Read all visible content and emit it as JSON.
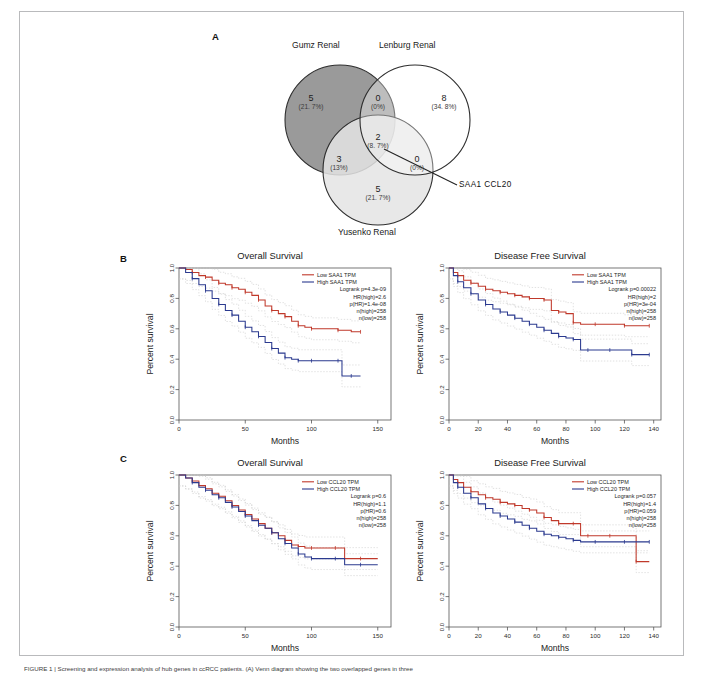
{
  "figure": {
    "panels": [
      {
        "letter": "A"
      },
      {
        "letter": "B"
      },
      {
        "letter": "C"
      }
    ],
    "caption": "FIGURE 1 | Screening and expression analysis of hub genes in ccRCC patients. (A) Venn diagram showing the two overlapped genes in three"
  },
  "venn": {
    "sets": [
      {
        "name": "Gumz Renal",
        "fill": "#9a9a9a"
      },
      {
        "name": "Lenburg Renal",
        "fill": "#ffffff"
      },
      {
        "name": "Yusenko Renal",
        "fill": "#e8e8e8"
      }
    ],
    "regions": [
      {
        "id": "gumz-only",
        "count": "5",
        "percent": "(21. 7%)"
      },
      {
        "id": "gumz-lenburg",
        "count": "0",
        "percent": "(0%)"
      },
      {
        "id": "lenburg-only",
        "count": "8",
        "percent": "(34. 8%)"
      },
      {
        "id": "gumz-yusenko",
        "count": "3",
        "percent": "(13%)"
      },
      {
        "id": "all-three",
        "count": "2",
        "percent": "(8. 7%)"
      },
      {
        "id": "lenburg-yusenko",
        "count": "0",
        "percent": "(0%)"
      },
      {
        "id": "yusenko-only",
        "count": "5",
        "percent": "(21. 7%)"
      }
    ],
    "annotation": "SAA1  CCL20"
  },
  "charts": [
    {
      "id": "panel-b-os",
      "panel": "B",
      "chart_data": {
        "type": "line",
        "title": "Overall Survival",
        "xlabel": "Months",
        "ylabel": "Percent survival",
        "xlim": [
          0,
          160
        ],
        "ylim": [
          0,
          1.0
        ],
        "xticks": [
          0,
          50,
          100,
          150
        ],
        "yticks": [
          "0.0",
          "0.2",
          "0.4",
          "0.6",
          "0.8",
          "1.0"
        ],
        "grid": false,
        "legend_position": "top-right",
        "legend": [
          "Low SAA1 TPM",
          "High SAA1 TPM"
        ],
        "stats": [
          "Logrank p=4.3e-09",
          "HR(high)=2.6",
          "p(HR)=1.4e-08",
          "n(high)=258",
          "n(low)=258"
        ],
        "series": [
          {
            "name": "Low SAA1 TPM",
            "color": "#c0392b",
            "x": [
              0,
              5,
              10,
              15,
              20,
              25,
              30,
              35,
              40,
              45,
              50,
              55,
              60,
              65,
              70,
              75,
              80,
              85,
              90,
              95,
              100,
              110,
              120,
              130,
              137
            ],
            "y": [
              1.0,
              0.99,
              0.97,
              0.95,
              0.94,
              0.92,
              0.9,
              0.89,
              0.87,
              0.86,
              0.84,
              0.82,
              0.79,
              0.75,
              0.72,
              0.7,
              0.68,
              0.65,
              0.62,
              0.61,
              0.6,
              0.6,
              0.59,
              0.58,
              0.58
            ]
          },
          {
            "name": "High SAA1 TPM",
            "color": "#2b3a8f",
            "x": [
              0,
              5,
              10,
              15,
              20,
              25,
              30,
              35,
              40,
              45,
              50,
              55,
              60,
              65,
              70,
              75,
              80,
              85,
              90,
              95,
              100,
              110,
              120,
              123,
              130,
              137
            ],
            "y": [
              1.0,
              0.97,
              0.93,
              0.89,
              0.85,
              0.8,
              0.76,
              0.72,
              0.69,
              0.65,
              0.61,
              0.58,
              0.55,
              0.51,
              0.47,
              0.44,
              0.41,
              0.4,
              0.39,
              0.39,
              0.39,
              0.39,
              0.39,
              0.29,
              0.29,
              0.29
            ]
          }
        ]
      }
    },
    {
      "id": "panel-b-dfs",
      "panel": "B",
      "chart_data": {
        "type": "line",
        "title": "Disease Free Survival",
        "xlabel": "Months",
        "ylabel": "Percent survival",
        "xlim": [
          0,
          145
        ],
        "ylim": [
          0,
          1.0
        ],
        "xticks": [
          0,
          20,
          40,
          60,
          80,
          100,
          120,
          140
        ],
        "yticks": [
          "0.0",
          "0.2",
          "0.4",
          "0.6",
          "0.8",
          "1.0"
        ],
        "grid": false,
        "legend_position": "top-right",
        "legend": [
          "Low SAA1 TPM",
          "High SAA1 TPM"
        ],
        "stats": [
          "Logrank p=0.00022",
          "HR(high)=2",
          "p(HR)=3e-04",
          "n(high)=258",
          "n(low)=258"
        ],
        "series": [
          {
            "name": "Low SAA1 TPM",
            "color": "#c0392b",
            "x": [
              0,
              3,
              6,
              10,
              15,
              20,
              25,
              30,
              35,
              40,
              45,
              50,
              55,
              60,
              65,
              70,
              75,
              80,
              85,
              90,
              100,
              110,
              120,
              130,
              137
            ],
            "y": [
              1.0,
              0.97,
              0.95,
              0.92,
              0.9,
              0.88,
              0.86,
              0.85,
              0.84,
              0.83,
              0.82,
              0.81,
              0.8,
              0.8,
              0.79,
              0.72,
              0.71,
              0.7,
              0.64,
              0.63,
              0.63,
              0.63,
              0.62,
              0.62,
              0.62
            ]
          },
          {
            "name": "High SAA1 TPM",
            "color": "#2b3a8f",
            "x": [
              0,
              3,
              6,
              10,
              15,
              20,
              25,
              30,
              35,
              40,
              45,
              50,
              55,
              60,
              65,
              70,
              75,
              80,
              85,
              90,
              95,
              100,
              110,
              120,
              125,
              130,
              137
            ],
            "y": [
              1.0,
              0.95,
              0.91,
              0.87,
              0.83,
              0.79,
              0.76,
              0.73,
              0.71,
              0.69,
              0.67,
              0.65,
              0.63,
              0.61,
              0.59,
              0.57,
              0.55,
              0.54,
              0.53,
              0.46,
              0.46,
              0.46,
              0.46,
              0.46,
              0.43,
              0.43,
              0.43
            ]
          }
        ]
      }
    },
    {
      "id": "panel-c-os",
      "panel": "C",
      "chart_data": {
        "type": "line",
        "title": "Overall Survival",
        "xlabel": "Months",
        "ylabel": "Percent survival",
        "xlim": [
          0,
          160
        ],
        "ylim": [
          0,
          1.0
        ],
        "xticks": [
          0,
          50,
          100,
          150
        ],
        "yticks": [
          "0.0",
          "0.2",
          "0.4",
          "0.6",
          "0.8",
          "1.0"
        ],
        "grid": false,
        "legend_position": "top-right",
        "legend": [
          "Low CCL20 TPM",
          "High CCL20 TPM"
        ],
        "stats": [
          "Logrank p=0.6",
          "HR(high)=1.1",
          "p(HR)=0.6",
          "n(high)=258",
          "n(low)=258"
        ],
        "series": [
          {
            "name": "Low CCL20 TPM",
            "color": "#c0392b",
            "x": [
              0,
              5,
              10,
              15,
              20,
              25,
              30,
              35,
              40,
              45,
              50,
              55,
              60,
              65,
              70,
              75,
              80,
              85,
              90,
              95,
              100,
              110,
              118,
              125,
              137,
              150
            ],
            "y": [
              1.0,
              0.98,
              0.96,
              0.93,
              0.91,
              0.88,
              0.86,
              0.83,
              0.8,
              0.77,
              0.74,
              0.71,
              0.68,
              0.65,
              0.62,
              0.6,
              0.57,
              0.54,
              0.53,
              0.52,
              0.52,
              0.52,
              0.52,
              0.45,
              0.45,
              0.45
            ]
          },
          {
            "name": "High CCL20 TPM",
            "color": "#2b3a8f",
            "x": [
              0,
              5,
              10,
              15,
              20,
              25,
              30,
              35,
              40,
              45,
              50,
              55,
              60,
              65,
              70,
              75,
              80,
              85,
              90,
              95,
              100,
              110,
              118,
              125,
              137,
              150
            ],
            "y": [
              1.0,
              0.98,
              0.95,
              0.92,
              0.9,
              0.87,
              0.85,
              0.82,
              0.79,
              0.76,
              0.73,
              0.7,
              0.67,
              0.65,
              0.62,
              0.58,
              0.55,
              0.52,
              0.48,
              0.46,
              0.45,
              0.45,
              0.45,
              0.41,
              0.41,
              0.41
            ]
          }
        ]
      }
    },
    {
      "id": "panel-c-dfs",
      "panel": "C",
      "chart_data": {
        "type": "line",
        "title": "Disease Free Survival",
        "xlabel": "Months",
        "ylabel": "Percent survival",
        "xlim": [
          0,
          145
        ],
        "ylim": [
          0,
          1.0
        ],
        "xticks": [
          0,
          20,
          40,
          60,
          80,
          100,
          120,
          140
        ],
        "yticks": [
          "0.0",
          "0.2",
          "0.4",
          "0.6",
          "0.8",
          "1.0"
        ],
        "grid": false,
        "legend_position": "top-right",
        "legend": [
          "Low CCL20 TPM",
          "High CCL20 TPM"
        ],
        "stats": [
          "Logrank p=0.057",
          "HR(high)=1.4",
          "p(HR)=0.059",
          "n(high)=258",
          "n(low)=258"
        ],
        "series": [
          {
            "name": "Low CCL20 TPM",
            "color": "#c0392b",
            "x": [
              0,
              3,
              6,
              10,
              15,
              20,
              25,
              30,
              35,
              40,
              45,
              50,
              55,
              60,
              65,
              70,
              75,
              80,
              85,
              90,
              95,
              100,
              110,
              120,
              128,
              137
            ],
            "y": [
              1.0,
              0.97,
              0.95,
              0.92,
              0.89,
              0.87,
              0.85,
              0.84,
              0.82,
              0.81,
              0.8,
              0.78,
              0.77,
              0.75,
              0.72,
              0.7,
              0.68,
              0.68,
              0.68,
              0.6,
              0.6,
              0.6,
              0.6,
              0.6,
              0.43,
              0.43
            ]
          },
          {
            "name": "High CCL20 TPM",
            "color": "#2b3a8f",
            "x": [
              0,
              3,
              6,
              10,
              15,
              20,
              25,
              30,
              35,
              40,
              45,
              50,
              55,
              60,
              65,
              70,
              75,
              80,
              85,
              90,
              100,
              110,
              120,
              130,
              137
            ],
            "y": [
              1.0,
              0.95,
              0.92,
              0.88,
              0.85,
              0.81,
              0.78,
              0.75,
              0.73,
              0.71,
              0.69,
              0.67,
              0.65,
              0.63,
              0.61,
              0.6,
              0.59,
              0.58,
              0.57,
              0.56,
              0.56,
              0.56,
              0.56,
              0.56,
              0.56
            ]
          }
        ]
      }
    }
  ]
}
